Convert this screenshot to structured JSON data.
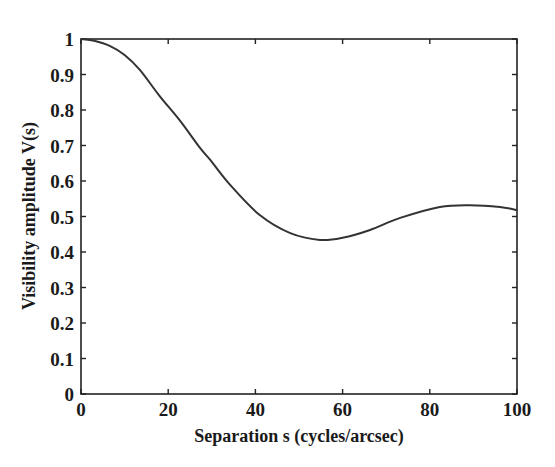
{
  "chart_data": {
    "type": "line",
    "title": "",
    "xlabel": "Separation s (cycles/arcsec)",
    "ylabel": "Visibility amplitude V(s)",
    "xlim": [
      0,
      100
    ],
    "ylim": [
      0,
      1
    ],
    "grid": false,
    "legend": null,
    "xticks": [
      0,
      20,
      40,
      60,
      80,
      100
    ],
    "xtick_labels": [
      "0",
      "20",
      "40",
      "60",
      "80",
      "100"
    ],
    "yticks": [
      0,
      0.1,
      0.2,
      0.3,
      0.4,
      0.5,
      0.6,
      0.7,
      0.8,
      0.9,
      1
    ],
    "ytick_labels": [
      "0",
      "0.1",
      "0.2",
      "0.3",
      "0.4",
      "0.5",
      "0.6",
      "0.7",
      "0.8",
      "0.9",
      "1"
    ],
    "series": [
      {
        "name": "V(s)",
        "color": "#333333",
        "x": [
          0,
          3,
          6.7,
          10,
          13.5,
          18,
          22.7,
          27.3,
          29.6,
          34.2,
          41,
          48,
          54.8,
          60,
          66.3,
          73.2,
          82.3,
          89.2,
          96.1,
          100
        ],
        "y": [
          1.0,
          0.995,
          0.98,
          0.955,
          0.913,
          0.84,
          0.77,
          0.693,
          0.66,
          0.589,
          0.504,
          0.453,
          0.434,
          0.44,
          0.462,
          0.496,
          0.527,
          0.532,
          0.527,
          0.518
        ]
      }
    ]
  }
}
